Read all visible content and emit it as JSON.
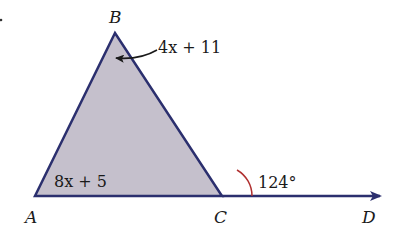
{
  "diagram": {
    "points": {
      "A": {
        "label": "A",
        "x": 35,
        "y": 196
      },
      "B": {
        "label": "B",
        "x": 115,
        "y": 33
      },
      "C": {
        "label": "C",
        "x": 222,
        "y": 196
      },
      "D": {
        "label": "D",
        "x": 380,
        "y": 196
      }
    },
    "angle_B_expr": "4x + 11",
    "angle_A_expr": "8x + 5",
    "exterior_angle": "124°",
    "colors": {
      "line": "#2b2f6e",
      "fill": "#c5c0cc",
      "arc": "#b03030",
      "text": "#1a1a1a"
    }
  }
}
